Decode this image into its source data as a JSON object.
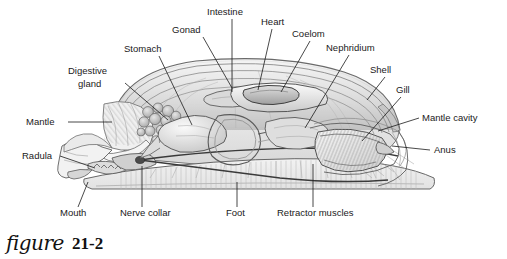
{
  "figure": {
    "caption_script": "figure",
    "caption_number": "21-2",
    "style": "grayscale pencil illustration"
  },
  "colors": {
    "background": "#ffffff",
    "ink": "#1a1a1a",
    "line": "#555555",
    "shade_light": "#ececec",
    "shade_mid": "#d2d2d2",
    "shade_dark": "#a9a9a9"
  },
  "labels": [
    {
      "id": "intestine",
      "text": "Intestine",
      "tx": 207,
      "ty": 15,
      "anchor": "start",
      "lead": [
        [
          232,
          19
        ],
        [
          232,
          92
        ]
      ]
    },
    {
      "id": "gonad",
      "text": "Gonad",
      "tx": 172,
      "ty": 33,
      "anchor": "start",
      "lead": [
        [
          203,
          37
        ],
        [
          232,
          88
        ]
      ]
    },
    {
      "id": "heart",
      "text": "Heart",
      "tx": 261,
      "ty": 25,
      "anchor": "start",
      "lead": [
        [
          272,
          29
        ],
        [
          258,
          90
        ]
      ]
    },
    {
      "id": "coelom",
      "text": "Coelom",
      "tx": 292,
      "ty": 37,
      "anchor": "start",
      "lead": [
        [
          310,
          41
        ],
        [
          281,
          92
        ]
      ]
    },
    {
      "id": "nephridium",
      "text": "Nephridium",
      "tx": 326,
      "ty": 51,
      "anchor": "start",
      "lead": [
        [
          349,
          55
        ],
        [
          305,
          128
        ]
      ]
    },
    {
      "id": "stomach",
      "text": "Stomach",
      "tx": 124,
      "ty": 52,
      "anchor": "start",
      "lead": [
        [
          159,
          56
        ],
        [
          192,
          125
        ]
      ]
    },
    {
      "id": "digestive-gland-1",
      "text": "Digestive",
      "tx": 68,
      "ty": 74,
      "anchor": "start",
      "lead": [
        [
          125,
          83
        ],
        [
          168,
          120
        ]
      ]
    },
    {
      "id": "digestive-gland-2",
      "text": "gland",
      "tx": 78,
      "ty": 87,
      "anchor": "start",
      "lead": null
    },
    {
      "id": "shell",
      "text": "Shell",
      "tx": 370,
      "ty": 73,
      "anchor": "start",
      "lead": [
        [
          385,
          77
        ],
        [
          367,
          100
        ]
      ]
    },
    {
      "id": "gill",
      "text": "Gill",
      "tx": 396,
      "ty": 93,
      "anchor": "start",
      "lead": [
        [
          401,
          97
        ],
        [
          362,
          141
        ]
      ]
    },
    {
      "id": "mantle-cavity",
      "text": "Mantle cavity",
      "tx": 422,
      "ty": 121,
      "anchor": "start",
      "lead": [
        [
          419,
          118
        ],
        [
          378,
          131
        ]
      ]
    },
    {
      "id": "anus",
      "text": "Anus",
      "tx": 434,
      "ty": 153,
      "anchor": "start",
      "lead": [
        [
          430,
          150
        ],
        [
          392,
          146
        ]
      ]
    },
    {
      "id": "mantle",
      "text": "Mantle",
      "tx": 26,
      "ty": 125,
      "anchor": "start",
      "lead": [
        [
          68,
          122
        ],
        [
          112,
          122
        ]
      ]
    },
    {
      "id": "radula",
      "text": "Radula",
      "tx": 22,
      "ty": 159,
      "anchor": "start",
      "lead": [
        [
          60,
          156
        ],
        [
          95,
          168
        ]
      ]
    },
    {
      "id": "mouth",
      "text": "Mouth",
      "tx": 60,
      "ty": 216,
      "anchor": "start",
      "lead": [
        [
          78,
          207
        ],
        [
          88,
          182
        ]
      ]
    },
    {
      "id": "nerve-collar",
      "text": "Nerve collar",
      "tx": 120,
      "ty": 216,
      "anchor": "start",
      "lead": [
        [
          142,
          207
        ],
        [
          142,
          166
        ]
      ]
    },
    {
      "id": "foot",
      "text": "Foot",
      "tx": 226,
      "ty": 216,
      "anchor": "start",
      "lead": [
        [
          237,
          207
        ],
        [
          237,
          182
        ]
      ]
    },
    {
      "id": "retractor-muscles",
      "text": "Retractor muscles",
      "tx": 277,
      "ty": 216,
      "anchor": "start",
      "lead": [
        [
          313,
          207
        ],
        [
          313,
          164
        ]
      ]
    }
  ]
}
